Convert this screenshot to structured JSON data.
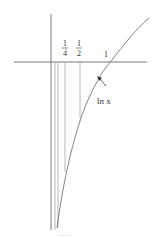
{
  "figure": {
    "type": "diagram",
    "curve_label": "ln x",
    "tick_labels": [
      {
        "num": "1",
        "den": "4",
        "value": 0.25
      },
      {
        "num": "1",
        "den": "2",
        "value": 0.5
      }
    ],
    "one_label": "1",
    "caption_fragment": "... . . . ."
  },
  "colors": {
    "axis": "#555555",
    "curve": "#666666",
    "guides": "#999999",
    "text": "#333333"
  }
}
